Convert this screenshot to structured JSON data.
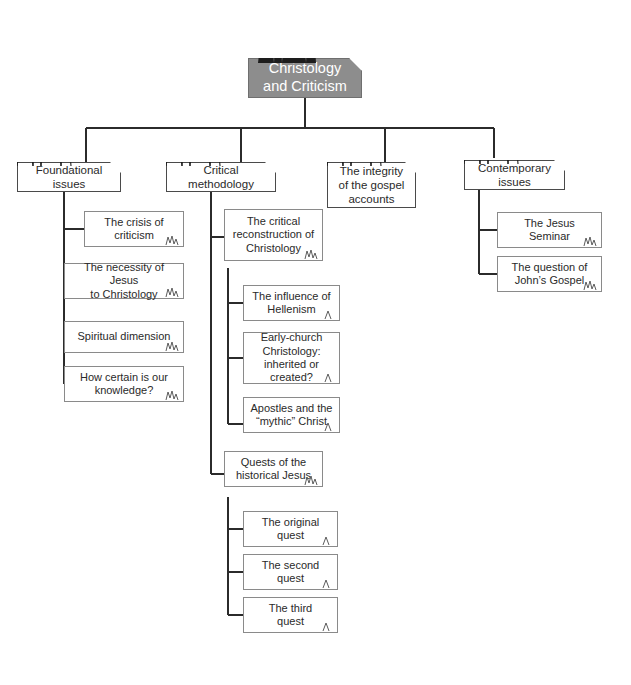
{
  "diagram": {
    "type": "tree-mindmap",
    "title": "Christology and Criticism",
    "root": {
      "label": "Christology\nand Criticism",
      "icon": "cathedral-icon",
      "fill_color": "#8d8d8d",
      "text_color": "#ffffff"
    },
    "branches": [
      {
        "id": "foundational-issues",
        "label": "Foundational\nissues",
        "icon": "cathedral-icon",
        "children": [
          {
            "id": "crisis-of-criticism",
            "label": "The crisis of\ncriticism"
          },
          {
            "id": "necessity-of-jesus",
            "label": "The necessity of Jesus\nto  Christology"
          },
          {
            "id": "spiritual-dimension",
            "label": "Spiritual dimension"
          },
          {
            "id": "how-certain-knowledge",
            "label": "How certain is our\nknowledge?"
          }
        ]
      },
      {
        "id": "critical-methodology",
        "label": "Critical\nmethodology",
        "icon": "cathedral-icon",
        "children": [
          {
            "id": "critical-reconstruction",
            "label": "The critical\nreconstruction of\nChristology",
            "children": [
              {
                "id": "influence-of-hellenism",
                "label": "The influence of\nHellenism"
              },
              {
                "id": "early-church-christology",
                "label": "Early-church\nChristology:\ninherited or created?"
              },
              {
                "id": "apostles-mythic-christ",
                "label": "Apostles and the\n“mythic” Christ"
              }
            ]
          },
          {
            "id": "quests-historical-jesus",
            "label": "Quests of the\nhistorical Jesus",
            "children": [
              {
                "id": "original-quest",
                "label": "The original\nquest"
              },
              {
                "id": "second-quest",
                "label": "The second\nquest"
              },
              {
                "id": "third-quest",
                "label": "The third\nquest"
              }
            ]
          }
        ]
      },
      {
        "id": "integrity-gospel-accounts",
        "label": "The integrity\nof the gospel\naccounts",
        "icon": "cathedral-icon",
        "children": []
      },
      {
        "id": "contemporary-issues",
        "label": "Contemporary\nissues",
        "icon": "cathedral-icon",
        "children": [
          {
            "id": "jesus-seminar",
            "label": "The Jesus Seminar"
          },
          {
            "id": "question-johns-gospel",
            "label": "The question of\nJohn’s Gospel"
          }
        ]
      }
    ]
  }
}
